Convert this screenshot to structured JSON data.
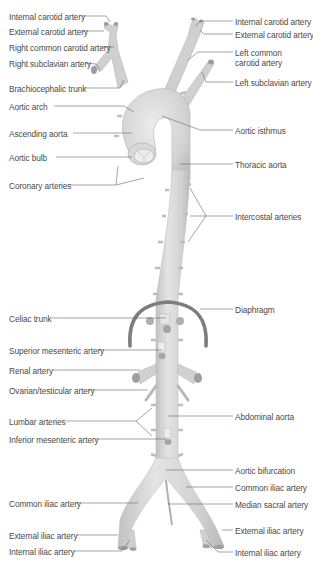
{
  "colors": {
    "vessel_fill": "#d6d6d6",
    "vessel_highlight": "#e6e6e6",
    "vessel_shadow": "#b4b4b4",
    "diaphragm": "#7a7a7a",
    "leader_line": "#6a6a6a",
    "label_text": "#4a4a4a",
    "background": "#ffffff"
  },
  "labels_left": [
    {
      "id": "internal-carotid-artery-left",
      "text": "Internal carotid artery",
      "x": 9,
      "y": 12
    },
    {
      "id": "external-carotid-artery-left",
      "text": "External carotid artery",
      "x": 9,
      "y": 27
    },
    {
      "id": "right-common-carotid-artery",
      "text": "Right common carotid artery",
      "x": 9,
      "y": 43
    },
    {
      "id": "right-subclavian-artery",
      "text": "Right subclavian artery",
      "x": 9,
      "y": 59
    },
    {
      "id": "brachiocephalic-trunk",
      "text": "Brachiocephalic trunk",
      "x": 9,
      "y": 84
    },
    {
      "id": "aortic-arch",
      "text": "Aortic arch",
      "x": 9,
      "y": 102
    },
    {
      "id": "ascending-aorta",
      "text": "Ascending aorta",
      "x": 9,
      "y": 129
    },
    {
      "id": "aortic-bulb",
      "text": "Aortic bulb",
      "x": 9,
      "y": 153
    },
    {
      "id": "coronary-arteries",
      "text": "Coronary arteries",
      "x": 9,
      "y": 181
    },
    {
      "id": "celiac-trunk",
      "text": "Celiac trunk",
      "x": 9,
      "y": 314
    },
    {
      "id": "superior-mesenteric-artery",
      "text": "Superior mesenteric artery",
      "x": 9,
      "y": 346
    },
    {
      "id": "renal-artery",
      "text": "Renal artery",
      "x": 9,
      "y": 366
    },
    {
      "id": "ovarian-testicular-artery",
      "text": "Ovarian/testicular artery",
      "x": 9,
      "y": 386
    },
    {
      "id": "lumbar-arteries",
      "text": "Lumbar arteries",
      "x": 9,
      "y": 417
    },
    {
      "id": "inferior-mesenteric-artery",
      "text": "Inferior mesenteric artery",
      "x": 9,
      "y": 435
    },
    {
      "id": "common-iliac-artery-left",
      "text": "Common iliac artery",
      "x": 9,
      "y": 499
    },
    {
      "id": "external-iliac-artery-left",
      "text": "External iliac artery",
      "x": 9,
      "y": 531
    },
    {
      "id": "internal-iliac-artery-left",
      "text": "Internal iliac artery",
      "x": 9,
      "y": 547
    }
  ],
  "labels_right": [
    {
      "id": "internal-carotid-artery-right",
      "text": "Internal carotid artery",
      "x": 235,
      "y": 17
    },
    {
      "id": "external-carotid-artery-right",
      "text": "External carotid artery",
      "x": 235,
      "y": 30
    },
    {
      "id": "left-common-carotid-artery",
      "text": "Left common\ncarotid artery",
      "x": 235,
      "y": 48
    },
    {
      "id": "left-subclavian-artery",
      "text": "Left subclavian artery",
      "x": 235,
      "y": 78
    },
    {
      "id": "aortic-isthmus",
      "text": "Aortic isthmus",
      "x": 235,
      "y": 126
    },
    {
      "id": "thoracic-aorta",
      "text": "Thoracic aorta",
      "x": 235,
      "y": 160
    },
    {
      "id": "intercostal-arteries",
      "text": "Intercostal arteries",
      "x": 235,
      "y": 212
    },
    {
      "id": "diaphragm",
      "text": "Diaphragm",
      "x": 235,
      "y": 305
    },
    {
      "id": "abdominal-aorta",
      "text": "Abdominal aorta",
      "x": 235,
      "y": 412
    },
    {
      "id": "aortic-bifurcation",
      "text": "Aortic bifurcation",
      "x": 235,
      "y": 466
    },
    {
      "id": "common-iliac-artery-right",
      "text": "Common iliac artery",
      "x": 235,
      "y": 483
    },
    {
      "id": "median-sacral-artery",
      "text": "Median sacral artery",
      "x": 235,
      "y": 500
    },
    {
      "id": "external-iliac-artery-right",
      "text": "External iliac artery",
      "x": 235,
      "y": 526
    },
    {
      "id": "internal-iliac-artery-right",
      "text": "Internal iliac artery",
      "x": 235,
      "y": 548
    }
  ]
}
